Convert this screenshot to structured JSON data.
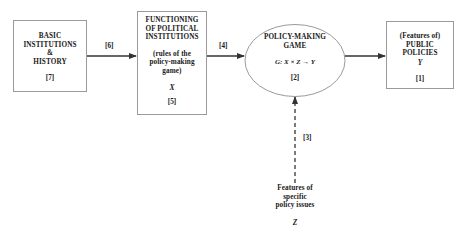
{
  "diagram": {
    "nodes": {
      "basic_institutions": {
        "lines": [
          "BASIC",
          "INSTITUTIONS",
          "&",
          "HISTORY"
        ],
        "ref": "[7]"
      },
      "functioning": {
        "title_lines": [
          "FUNCTIONING",
          "OF POLITICAL",
          "INSTITUTIONS"
        ],
        "sub_lines": [
          "(rules of the",
          "policy-making",
          "game)"
        ],
        "var": "X",
        "ref": "[5]"
      },
      "policy_game": {
        "title_lines": [
          "POLICY-MAKING",
          "GAME"
        ],
        "formula": "G: X × Z → Y",
        "ref": "[2]"
      },
      "public_policies": {
        "lines": [
          "(Features of)",
          "PUBLIC",
          "POLICIES"
        ],
        "var": "Y",
        "ref": "[1]"
      },
      "policy_issues": {
        "lines": [
          "Features of",
          "specific",
          "policy issues"
        ],
        "var": "Z"
      }
    },
    "edges": [
      {
        "from": "basic_institutions",
        "to": "functioning",
        "label": "[6]",
        "style": "solid"
      },
      {
        "from": "functioning",
        "to": "policy_game",
        "label": "[4]",
        "style": "solid"
      },
      {
        "from": "policy_game",
        "to": "public_policies",
        "label": "",
        "style": "solid"
      },
      {
        "from": "policy_issues",
        "to": "policy_game",
        "label": "[3]",
        "style": "dashed"
      }
    ],
    "colors": {
      "line": "#333333",
      "border": "#9a9a9a",
      "text": "#1a1a1a"
    }
  }
}
